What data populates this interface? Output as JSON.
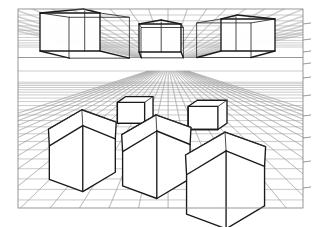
{
  "figure": {
    "background_color": "#ffffff",
    "grid_color": "#8a8a8a",
    "frame_color": "#7d7d7d",
    "cube_edge_color": "#1a1a1a"
  },
  "frame": {
    "left": 18,
    "top": 9,
    "right": 303,
    "bottom": 208
  },
  "horizon": {
    "y": 64.5,
    "gap_top": 57.5,
    "gap_bottom": 71.0,
    "vanishing_point_x": 168,
    "vanishing_point_y": 64.5,
    "left_vp_x": -520,
    "right_vp_x": 860
  },
  "ceiling_plane": {
    "name": "ceiling-grid",
    "edge_y": 57.5,
    "depth_lines": 26,
    "cross_lines": 16
  },
  "floor_plane": {
    "name": "floor-grid",
    "edge_y": 71.0,
    "depth_lines": 30,
    "cross_lines": 20
  },
  "ceiling_boxes": [
    {
      "name": "ceiling-box-left",
      "cx": 70,
      "cy": 32,
      "w": 60,
      "h": 38,
      "depth": 30
    },
    {
      "name": "ceiling-box-center",
      "cx": 160,
      "cy": 38,
      "w": 42,
      "h": 28,
      "depth": 18
    },
    {
      "name": "ceiling-box-right",
      "cx": 248,
      "cy": 35,
      "w": 54,
      "h": 32,
      "depth": 24
    }
  ],
  "floor_cubes": [
    {
      "name": "floor-cube-far-left",
      "cx": 131,
      "cy": 112,
      "size": 22,
      "depth": 12
    },
    {
      "name": "floor-cube-far-right",
      "cx": 203,
      "cy": 117,
      "size": 24,
      "depth": 13
    },
    {
      "name": "floor-cube-mid-left",
      "cx": 81,
      "cy": 152,
      "size": 44,
      "depth": 26
    },
    {
      "name": "floor-cube-mid-center",
      "cx": 155,
      "cy": 158,
      "size": 45,
      "depth": 27
    },
    {
      "name": "floor-cube-near-right",
      "cx": 224,
      "cy": 182,
      "size": 52,
      "depth": 32
    }
  ],
  "counts": {
    "ceiling_boxes": 3,
    "floor_cubes": 5,
    "total_objects": 8
  }
}
